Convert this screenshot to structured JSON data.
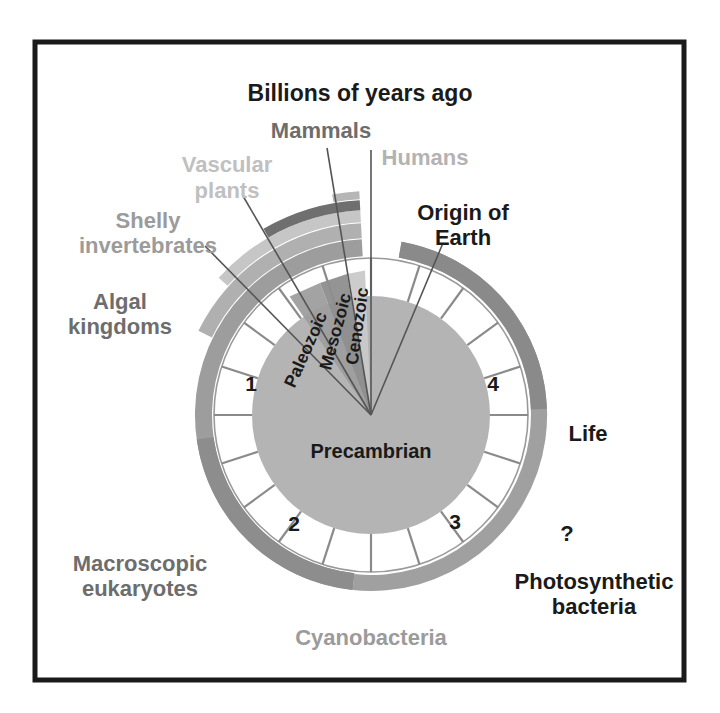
{
  "figure": {
    "title": "Billions of years ago",
    "frame_color": "#1a1a1a",
    "background": "#ffffff"
  },
  "dial": {
    "center_x": 371,
    "center_y": 415,
    "outer_radius": 157,
    "inner_disc_radius": 119,
    "face_color": "#ffffff",
    "inner_disc_color": "#b3b3b3",
    "outline_color": "#9a9a9a",
    "tick_color": "#8a8a8a",
    "hour_numbers": [
      "1",
      "2",
      "3",
      "4"
    ],
    "tick_count": 20,
    "center_label": "Precambrian"
  },
  "eras": [
    {
      "name": "Paleozoic",
      "color": "#9d9d9d"
    },
    {
      "name": "Mesozoic",
      "color": "#8c8c8c"
    },
    {
      "name": "Cenozoic",
      "color": "#c9c9c9"
    }
  ],
  "labels": {
    "title": "Billions of years ago",
    "mammals": "Mammals",
    "humans": "Humans",
    "vascular_plants_line1": "Vascular",
    "vascular_plants_line2": "plants",
    "shelly_line1": "Shelly",
    "shelly_line2": "invertebrates",
    "algal_line1": "Algal",
    "algal_line2": "kingdoms",
    "origin_line1": "Origin of",
    "origin_line2": "Earth",
    "life": "Life",
    "question": "?",
    "photosynthetic_line1": "Photosynthetic",
    "photosynthetic_line2": "bacteria",
    "cyanobacteria": "Cyanobacteria",
    "macroscopic_line1": "Macroscopic",
    "macroscopic_line2": "eukaryotes",
    "precambrian": "Precambrian"
  },
  "label_colors": {
    "dark": "#1a1a1a",
    "mid_gray": "#8d8d8d",
    "light_gray": "#b6b6b6",
    "era_text": "#1a1a1a"
  },
  "bands": [
    {
      "name": "algal-kingdoms",
      "color": "#9d9d9d",
      "radius": 176,
      "thickness": 17,
      "start_deg": 186,
      "end_deg": 357
    },
    {
      "name": "macroscopic-eukaryotes",
      "color": "#8d8d8d",
      "radius": 176,
      "thickness": 17,
      "start_deg": 186,
      "end_deg": 262
    },
    {
      "name": "shelly-invertebrates",
      "color": "#b0b0b0",
      "radius": 192,
      "thickness": 15,
      "start_deg": 296,
      "end_deg": 357
    },
    {
      "name": "vascular-plants",
      "color": "#c6c6c6",
      "radius": 205,
      "thickness": 12,
      "start_deg": 312,
      "end_deg": 357
    },
    {
      "name": "mammals",
      "color": "#6f6f6f",
      "radius": 215,
      "thickness": 10,
      "start_deg": 330,
      "end_deg": 357
    },
    {
      "name": "humans",
      "color": "#b6b6b6",
      "radius": 224,
      "thickness": 8,
      "start_deg": 350,
      "end_deg": 357
    },
    {
      "name": "cyanobacteria",
      "color": "#a0a0a0",
      "radius": 176,
      "thickness": 16,
      "start_deg": 10,
      "end_deg": 186
    },
    {
      "name": "photosynthetic-bacteria",
      "color": "#8a8a8a",
      "radius": 176,
      "thickness": 16,
      "start_deg": 10,
      "end_deg": 57
    },
    {
      "name": "life",
      "color": "#8a8a8a",
      "radius": 176,
      "thickness": 16,
      "start_deg": 57,
      "end_deg": 88
    }
  ],
  "chart_data": {
    "type": "pie",
    "title": "Billions of years ago",
    "units": "billions of years before present",
    "scale_max": 4.6,
    "dial_direction": "counterclockwise from 12 o'clock",
    "tick_labels": [
      "1",
      "2",
      "3",
      "4"
    ],
    "events": [
      {
        "label": "Origin of Earth",
        "age_bya": 4.6
      },
      {
        "label": "Life",
        "age_bya": 3.8
      },
      {
        "label": "?",
        "age_bya": 3.5
      },
      {
        "label": "Photosynthetic bacteria",
        "age_bya": 3.4
      },
      {
        "label": "Cyanobacteria",
        "age_bya": 2.8
      },
      {
        "label": "Macroscopic eukaryotes",
        "age_bya": 1.8
      },
      {
        "label": "Algal kingdoms",
        "age_bya": 1.2
      },
      {
        "label": "Shelly invertebrates",
        "age_bya": 0.54
      },
      {
        "label": "Vascular plants",
        "age_bya": 0.42
      },
      {
        "label": "Mammals",
        "age_bya": 0.22
      },
      {
        "label": "Humans",
        "age_bya": 0.05
      }
    ],
    "eras": [
      {
        "label": "Precambrian",
        "start_bya": 4.6,
        "end_bya": 0.541
      },
      {
        "label": "Paleozoic",
        "start_bya": 0.541,
        "end_bya": 0.252
      },
      {
        "label": "Mesozoic",
        "start_bya": 0.252,
        "end_bya": 0.066
      },
      {
        "label": "Cenozoic",
        "start_bya": 0.066,
        "end_bya": 0.0
      }
    ]
  }
}
